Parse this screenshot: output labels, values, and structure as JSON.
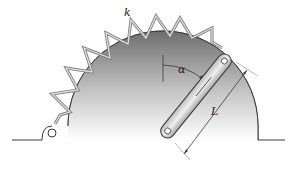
{
  "figure": {
    "type": "mechanism-diagram",
    "labels": {
      "spring": "k",
      "angle": "α",
      "length": "L"
    },
    "colors": {
      "drum_dark": "#6e6e6e",
      "drum_light": "#ffffff",
      "spring": "#9a9a9a",
      "link": "#d8d8d8",
      "outline": "#3a3a3a"
    }
  }
}
